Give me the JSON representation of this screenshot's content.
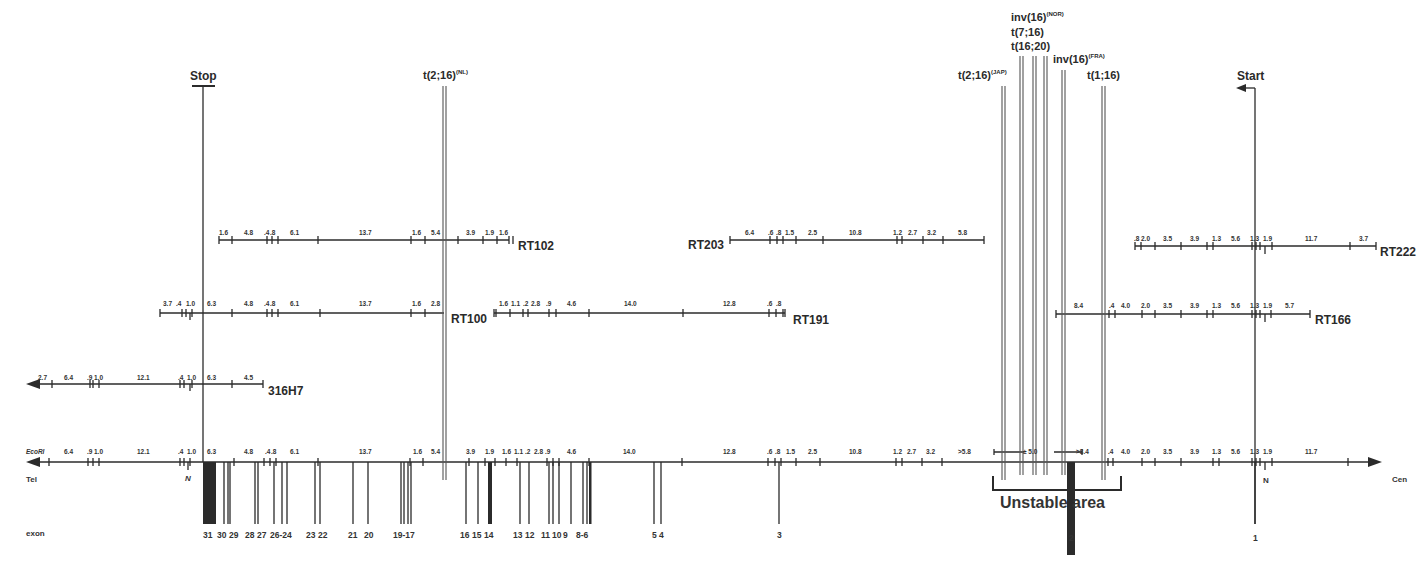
{
  "colors": {
    "line": "#2b2b2b",
    "bar": "#111111",
    "breakpoint": "#555555",
    "text": "#2a2a2a"
  },
  "labels": {
    "enzyme": "EcoRI",
    "tel": "Tel",
    "cen": "Cen",
    "exon": "exon",
    "stop": "Stop",
    "start": "Start",
    "n_left": "N",
    "n_right": "N",
    "unstable": "Unstable area",
    "plusminus": "± 5.0"
  },
  "main_map": {
    "fragments_left": [
      "6.4",
      ".9",
      "1.0",
      "12.1",
      ".4",
      "1.0",
      "6.3",
      "4.8",
      ".4",
      ".8",
      "6.1",
      "13.7",
      "1.6",
      "5.4",
      "3.9",
      "1.9",
      "1.6",
      "1.1",
      ".2",
      "2.8",
      ".9",
      "4.6",
      "14.0",
      "12.8",
      ".6",
      ".8",
      "1.5",
      "2.5",
      "10.8",
      "1.2",
      "2.7",
      "3.2",
      ">5.8"
    ],
    "fragments_right": [
      ">8.4",
      ".4",
      "4.0",
      "2.0",
      "3.5",
      "3.9",
      "1.3",
      "5.6",
      "1.3",
      "1.9",
      "11.7"
    ]
  },
  "clones": [
    {
      "name": "RT102",
      "fragments": [
        "1.6",
        "4.8",
        ".4",
        ".8",
        "6.1",
        "13.7",
        "1.6",
        "5.4",
        "3.9",
        "1.9",
        "1.6"
      ]
    },
    {
      "name": "RT203",
      "fragments": [
        "6.4",
        ".6",
        ".8",
        "1.5",
        "2.5",
        "10.8",
        "1.2",
        "2.7",
        "3.2",
        "5.8"
      ]
    },
    {
      "name": "RT222",
      "fragments": [
        ".8",
        "2.0",
        "3.5",
        "3.9",
        "1.3",
        "5.6",
        "1.3",
        "1.9",
        "11.7",
        "3.7"
      ]
    },
    {
      "name": "RT100",
      "fragments": [
        "3.7",
        ".4",
        "1.0",
        "6.3",
        "4.8",
        ".4",
        ".8",
        "6.1",
        "13.7",
        "1.6",
        "2.8"
      ]
    },
    {
      "name": "RT191",
      "fragments": [
        "1.6",
        "1.1",
        ".2",
        "2.8",
        ".9",
        "4.6",
        "14.0",
        "12.8",
        ".6",
        ".8"
      ]
    },
    {
      "name": "RT166",
      "fragments": [
        "8.4",
        ".4",
        "4.0",
        "2.0",
        "3.5",
        "3.9",
        "1.3",
        "5.6",
        "1.3",
        "1.9",
        "5.7"
      ]
    },
    {
      "name": "316H7",
      "fragments": [
        "2.7",
        "6.4",
        ".9",
        "1.0",
        "12.1",
        ".4",
        "1.0",
        "6.3",
        "4.5"
      ]
    }
  ],
  "breakpoints": [
    {
      "name": "t(2;16)",
      "sup": "(NL)"
    },
    {
      "name": "t(2;16)",
      "sup": "(JAP)"
    },
    {
      "name": "inv(16)",
      "sup": "(NOR)"
    },
    {
      "name": "t(7;16)",
      "sup": ""
    },
    {
      "name": "t(16;20)",
      "sup": ""
    },
    {
      "name": "inv(16)",
      "sup": "(FRA)"
    },
    {
      "name": "t(1;16)",
      "sup": ""
    }
  ],
  "exons": [
    "31",
    "30",
    "29",
    "28",
    "27",
    "26-24",
    "23",
    "22",
    "21",
    "20",
    "19-17",
    "16",
    "15",
    "14",
    "13",
    "12",
    "11",
    "10",
    "9",
    "8-6",
    "5",
    "4",
    "3",
    "2",
    "1"
  ]
}
